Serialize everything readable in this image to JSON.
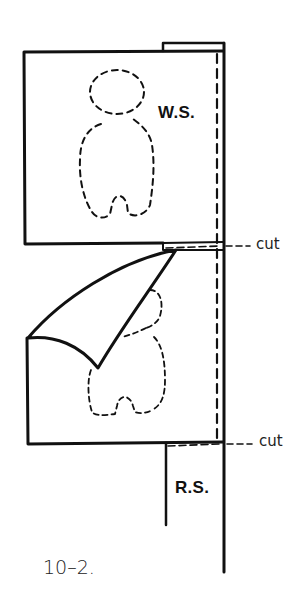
{
  "figure": {
    "number_label": "10–2.",
    "labels": {
      "wrong_side": "W.S.",
      "right_side": "R.S.",
      "cut_top": "cut",
      "cut_bottom": "cut"
    },
    "colors": {
      "line": "#111111",
      "background": "#ffffff"
    }
  }
}
